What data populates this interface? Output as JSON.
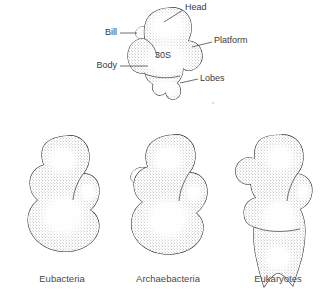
{
  "figure": {
    "title_present": false,
    "background_color": "#ffffff",
    "ink_color": "#2f2f2f",
    "stipple_color": "#6a6a6a"
  },
  "top_diagram": {
    "name": "30S ribosomal subunit anatomy",
    "center_label": "30S",
    "labels": [
      {
        "id": "head",
        "text": "Head",
        "side": "right"
      },
      {
        "id": "bill",
        "text": "Bill",
        "side": "left"
      },
      {
        "id": "platform",
        "text": "Platform",
        "side": "right"
      },
      {
        "id": "body",
        "text": "Body",
        "side": "left"
      },
      {
        "id": "lobes",
        "text": "Lobes",
        "side": "right"
      }
    ]
  },
  "specimens": [
    {
      "id": "eubacteria",
      "caption": "Eubacteria"
    },
    {
      "id": "archaebacteria",
      "caption": "Archaebacteria"
    },
    {
      "id": "eukaryotes",
      "caption": "Eukaryotes"
    }
  ]
}
